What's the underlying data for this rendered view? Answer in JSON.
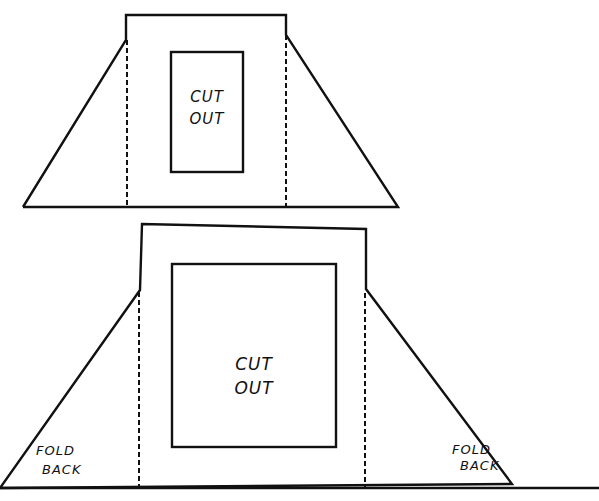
{
  "diagram": {
    "top_template": {
      "cutout_label_line1": "CUT",
      "cutout_label_line2": "OUT"
    },
    "bottom_template": {
      "cutout_label_line1": "CUT",
      "cutout_label_line2": "OUT",
      "left_flap_line1": "FOLD",
      "left_flap_line2": "BACK",
      "right_flap_line1": "FOLD",
      "right_flap_line2": "BACK"
    },
    "colors": {
      "line": "#111111",
      "background": "#ffffff"
    }
  }
}
